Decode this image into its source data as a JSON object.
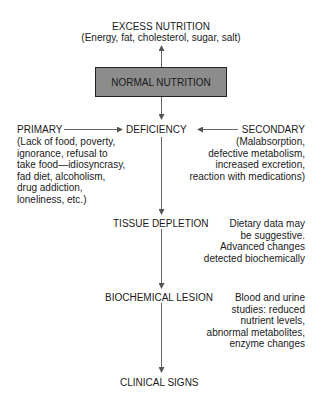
{
  "excess": {
    "title": "EXCESS NUTRITION",
    "detail": "(Energy, fat, cholesterol, sugar, salt)"
  },
  "normal": {
    "label": "NORMAL NUTRITION",
    "fill": "#8c8c8c"
  },
  "deficiency": {
    "label": "DEFICIENCY"
  },
  "primary": {
    "title": "PRIMARY",
    "lines": [
      "(Lack of food, poverty,",
      "ignorance, refusal to",
      "take food—idiosyncrasy,",
      "fad diet, alcoholism,",
      "drug addiction,",
      "loneliness, etc.)"
    ]
  },
  "secondary": {
    "title": "SECONDARY",
    "lines": [
      "(Malabsorption,",
      "defective metabolism,",
      "increased excretion,",
      "reaction with medications)"
    ]
  },
  "tissue": {
    "label": "TISSUE DEPLETION",
    "note": [
      "Dietary data may",
      "be suggestive.",
      "Advanced changes",
      "detected biochemically"
    ]
  },
  "biochemical": {
    "label": "BIOCHEMICAL LESION",
    "note": [
      "Blood and urine",
      "studies: reduced",
      "nutrient levels,",
      "abnormal metabolites,",
      "enzyme changes"
    ]
  },
  "clinical": {
    "label": "CLINICAL SIGNS"
  }
}
